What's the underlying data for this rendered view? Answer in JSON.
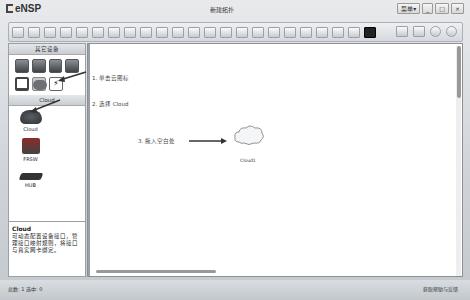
{
  "window": {
    "app_name": "eNSP",
    "title": "新建拓扑",
    "controls": {
      "menu": "菜单▾",
      "minimize": "_",
      "maximize": "□",
      "close": "×"
    }
  },
  "toolbar": {
    "left_icons": [
      "new-topology-icon",
      "new-lab-icon",
      "open-icon",
      "save-icon",
      "save-as-icon",
      "print-icon",
      "undo-icon",
      "redo-icon",
      "select-icon",
      "move-icon",
      "delete-icon",
      "delete-all-icon",
      "text-icon",
      "rectangle-icon",
      "zoom-in-icon",
      "zoom-out-icon",
      "fit-icon",
      "start-icon",
      "stop-icon",
      "capture-icon",
      "topo-icon",
      "device-list-icon",
      "cli-icon"
    ],
    "right_icons": [
      "console-icon",
      "home-icon",
      "settings-icon",
      "help-icon"
    ]
  },
  "left_panel": {
    "category_header": "其它设备",
    "category_icons": [
      "router-category-icon",
      "switch-category-icon",
      "wlan-category-icon",
      "firewall-category-icon",
      "pc-category-icon",
      "cloud-category-icon",
      "power-category-icon"
    ],
    "device_header": "Cloud",
    "devices": [
      {
        "label": "Cloud",
        "icon": "cloud-device-icon"
      },
      {
        "label": "FRSW",
        "icon": "frsw-device-icon"
      },
      {
        "label": "HUB",
        "icon": "hub-device-icon"
      }
    ],
    "description": {
      "title": "Cloud",
      "body": "可动态配置设备接口，管理接口映射规则，将接口与真实网卡绑定。"
    }
  },
  "canvas": {
    "steps": [
      {
        "text": "1.  单击云图标"
      },
      {
        "text": "2.  选择 Cloud"
      },
      {
        "text": "3.  拖入空白处"
      }
    ],
    "node": {
      "label": "Cloud1"
    }
  },
  "status_bar": {
    "left": "总数: 1  选中: 0",
    "right": "获取帮助与反馈"
  },
  "colors": {
    "chrome": "#cfd3d8",
    "canvas": "#ffffff",
    "annotation_arrow": "#333333"
  }
}
